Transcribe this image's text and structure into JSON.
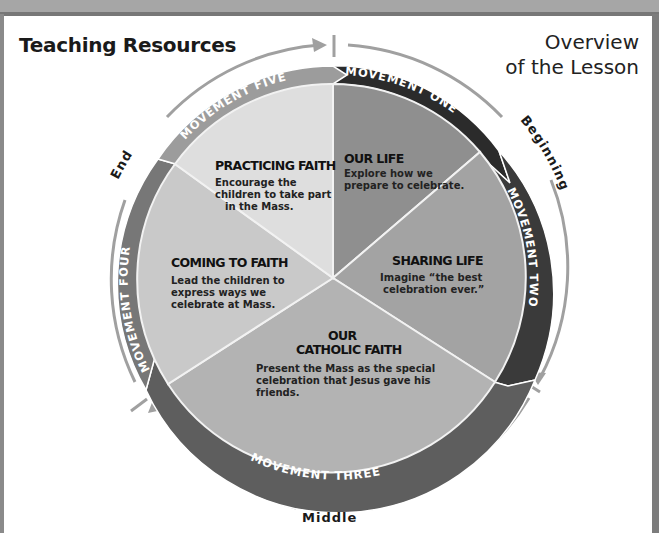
{
  "header": {
    "title": "Teaching Resources",
    "subtitle_line1": "Overview",
    "subtitle_line2": "of the Lesson"
  },
  "phases": {
    "beginning": "Beginning",
    "middle": "Middle",
    "end": "End"
  },
  "movements": [
    {
      "band_label": "MOVEMENT ONE",
      "title": "OUR LIFE",
      "body_lines": [
        "Explore how we",
        "prepare to celebrate."
      ],
      "band_color": "#2b2b2b",
      "fill_color": "#8f8f8f"
    },
    {
      "band_label": "MOVEMENT TWO",
      "title": "SHARING LIFE",
      "body_lines": [
        "Imagine “the best",
        "celebration ever.”"
      ],
      "band_color": "#3a3a3a",
      "fill_color": "#a3a3a3"
    },
    {
      "band_label": "MOVEMENT THREE",
      "title_line1": "OUR",
      "title_line2": "CATHOLIC FAITH",
      "body_lines": [
        "Present the Mass as the special",
        "celebration that Jesus gave his",
        "friends."
      ],
      "band_color": "#5e5e5e",
      "fill_color": "#b3b3b3"
    },
    {
      "band_label": "MOVEMENT FOUR",
      "title": "COMING TO FAITH",
      "body_lines": [
        "Lead the children to",
        "express ways we",
        "celebrate at Mass."
      ],
      "band_color": "#777777",
      "fill_color": "#c9c9c9"
    },
    {
      "band_label": "MOVEMENT FIVE",
      "title": "PRACTICING FAITH",
      "body_lines": [
        "Encourage the",
        "children to take part",
        "in the Mass."
      ],
      "band_color": "#9c9c9c",
      "fill_color": "#dedede"
    }
  ],
  "colors": {
    "arrow_grey": "#a0a0a0",
    "divider": "#f2f2f2"
  }
}
